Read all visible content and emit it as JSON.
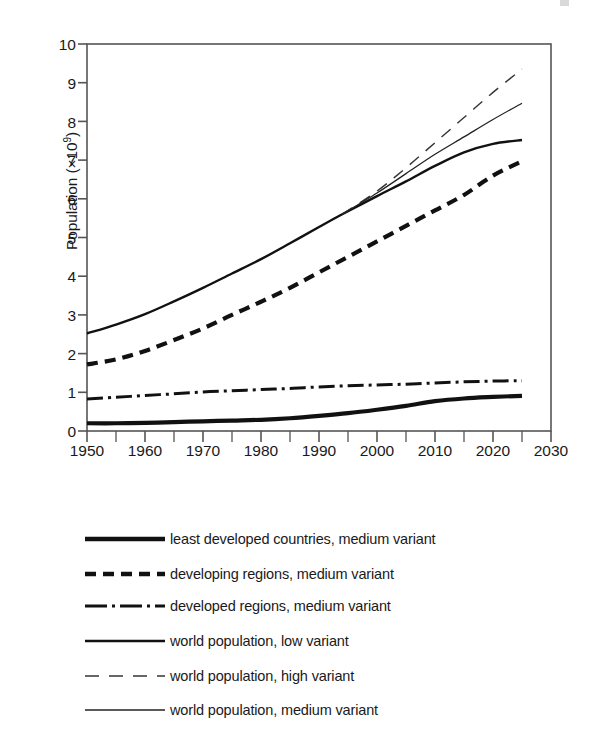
{
  "chart_data": {
    "type": "line",
    "title": "",
    "xlabel": "",
    "ylabel": "Population (×10⁹)",
    "ylabel_base": "Population (×10",
    "ylabel_exp": "9",
    "ylabel_close": ")",
    "xlim": [
      1950,
      2030
    ],
    "ylim": [
      0,
      10
    ],
    "grid": false,
    "legend_position": "below",
    "x_ticks": [
      "1950",
      "1960",
      "1970",
      "1980",
      "1990",
      "2000",
      "2010",
      "2020",
      "2030"
    ],
    "x_tick_values": [
      1950,
      1960,
      1970,
      1980,
      1990,
      2000,
      2010,
      2020,
      2030
    ],
    "x_minor_tick_values": [
      1955,
      1965,
      1975,
      1985,
      1995,
      2005,
      2015,
      2025
    ],
    "y_ticks": [
      "0",
      "1",
      "2",
      "3",
      "4",
      "5",
      "6",
      "7",
      "8",
      "9",
      "10"
    ],
    "y_tick_values": [
      0,
      1,
      2,
      3,
      4,
      5,
      6,
      7,
      8,
      9,
      10
    ],
    "series": [
      {
        "name": "least developed countries, medium variant",
        "style": "solid-thick",
        "color": "#111111",
        "width": 4.2,
        "dash": "",
        "x": [
          1950,
          1955,
          1960,
          1965,
          1970,
          1975,
          1980,
          1985,
          1990,
          1995,
          2000,
          2005,
          2010,
          2015,
          2020,
          2025
        ],
        "values": [
          0.2,
          0.2,
          0.21,
          0.23,
          0.25,
          0.27,
          0.29,
          0.33,
          0.39,
          0.46,
          0.55,
          0.65,
          0.77,
          0.84,
          0.88,
          0.91
        ]
      },
      {
        "name": "developing regions, medium variant",
        "style": "dashed-thick",
        "color": "#111111",
        "width": 4.2,
        "dash": "11,7",
        "x": [
          1950,
          1955,
          1960,
          1965,
          1970,
          1975,
          1980,
          1985,
          1990,
          1995,
          2000,
          2005,
          2010,
          2015,
          2020,
          2025
        ],
        "values": [
          1.72,
          1.85,
          2.07,
          2.35,
          2.65,
          3.0,
          3.34,
          3.7,
          4.1,
          4.5,
          4.9,
          5.3,
          5.7,
          6.1,
          6.6,
          6.97
        ]
      },
      {
        "name": "developed regions, medium variant",
        "style": "dash-dot",
        "color": "#111111",
        "width": 3.0,
        "dash": "16,5,3,5",
        "x": [
          1950,
          1955,
          1960,
          1965,
          1970,
          1975,
          1980,
          1985,
          1990,
          1995,
          2000,
          2005,
          2010,
          2015,
          2020,
          2025
        ],
        "values": [
          0.83,
          0.87,
          0.92,
          0.96,
          1.01,
          1.04,
          1.07,
          1.1,
          1.14,
          1.17,
          1.19,
          1.21,
          1.24,
          1.27,
          1.29,
          1.3
        ]
      },
      {
        "name": "world population, low variant",
        "style": "solid-medium",
        "color": "#111111",
        "width": 2.4,
        "dash": "",
        "x": [
          1950,
          1955,
          1960,
          1965,
          1970,
          1975,
          1980,
          1985,
          1990,
          1994,
          2000,
          2005,
          2010,
          2015,
          2020,
          2025
        ],
        "values": [
          2.52,
          2.75,
          3.02,
          3.35,
          3.7,
          4.07,
          4.44,
          4.85,
          5.27,
          5.6,
          6.07,
          6.45,
          6.85,
          7.2,
          7.42,
          7.52
        ]
      },
      {
        "name": "world population, high variant",
        "style": "dashed-thin",
        "color": "#333333",
        "width": 1.4,
        "dash": "12,9",
        "x": [
          1994,
          2000,
          2005,
          2010,
          2015,
          2020,
          2025
        ],
        "values": [
          5.6,
          6.2,
          6.8,
          7.45,
          8.1,
          8.75,
          9.35
        ]
      },
      {
        "name": "world population, medium variant",
        "style": "solid-thin",
        "color": "#222222",
        "width": 1.3,
        "x": [
          1994,
          2000,
          2005,
          2010,
          2015,
          2020,
          2025
        ],
        "values": [
          5.6,
          6.15,
          6.65,
          7.15,
          7.6,
          8.05,
          8.47
        ]
      }
    ],
    "annotations": [],
    "branch_point": {
      "x": 1994,
      "y": 5.6
    }
  },
  "legend": {
    "entries": [
      {
        "label": "least developed countries, medium variant",
        "swatch": "solid-thick-line-swatch"
      },
      {
        "label": "developing regions, medium variant",
        "swatch": "dashed-thick-line-swatch"
      },
      {
        "label": "developed regions, medium variant",
        "swatch": "dash-dot-line-swatch"
      },
      {
        "label": "world population, low variant",
        "swatch": "solid-medium-line-swatch"
      },
      {
        "label": "world population, high variant",
        "swatch": "dashed-thin-line-swatch"
      },
      {
        "label": "world population, medium variant",
        "swatch": "solid-thin-line-swatch"
      }
    ]
  },
  "colors": {
    "ink": "#111111",
    "axis": "#4a4a4a",
    "background": "#ffffff"
  }
}
